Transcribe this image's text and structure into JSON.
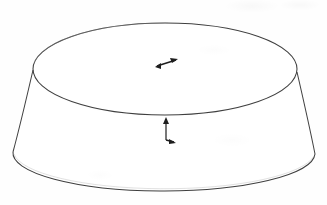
{
  "figure": {
    "title": "Truncated cone (conical frustum) line drawing",
    "type": "geometric-solid-diagram",
    "solid_name": "frustum",
    "background_color": "#fefefe",
    "stroke_color": "#3a3a3a",
    "stroke_width": 1,
    "canvas": {
      "width": 327,
      "height": 205
    },
    "top_ellipse": {
      "label": "top circular face",
      "center_x": 165,
      "center_y": 69,
      "radius_x": 132,
      "radius_y": 46
    },
    "bottom_ellipse": {
      "label": "bottom circular face",
      "center_x": 164,
      "center_y": 152,
      "radius_x": 151,
      "radius_y": 38
    },
    "left_side_edge": {
      "label": "left slant edge",
      "x1": 33,
      "y1": 70,
      "x2": 13,
      "y2": 152
    },
    "right_side_edge": {
      "label": "right slant edge",
      "x1": 297,
      "y1": 72,
      "x2": 315,
      "y2": 154
    },
    "annotations": [
      {
        "name": "radius-arrow",
        "label": "radius arrow on top face",
        "kind": "arrow",
        "direction": "up-right",
        "x": 165,
        "y": 64,
        "length": 20
      },
      {
        "name": "height-arrow",
        "label": "height / axis arrow",
        "kind": "double-arrow",
        "direction": "vertical",
        "x": 166,
        "y_top": 120,
        "y_bottom": 140,
        "foot_direction": "down-right"
      }
    ],
    "axis_labels": [],
    "dimension_texts": []
  }
}
